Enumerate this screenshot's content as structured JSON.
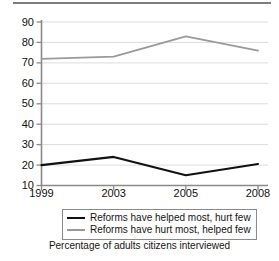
{
  "figure": {
    "top_rule": "horizontal-rule",
    "caption": "Percentage of adults citizens interviewed"
  },
  "legend": {
    "position": "below-axis",
    "entries": [
      {
        "label": "Reforms have helped most, hurt few",
        "color": "#111111",
        "swatch": "line-swatch-black"
      },
      {
        "label": "Reforms have hurt most, helped few",
        "color": "#9a9a9a",
        "swatch": "line-swatch-gray"
      }
    ]
  },
  "axes": {
    "y_ticks": [
      "90",
      "80",
      "70",
      "60",
      "50",
      "40",
      "30",
      "20",
      "10"
    ],
    "x_ticks": [
      "1999",
      "2003",
      "2005",
      "2008"
    ]
  },
  "chart_data": {
    "type": "line",
    "title": "",
    "subtitle": "",
    "xlabel": "",
    "ylabel": "",
    "caption": "Percentage of adults citizens interviewed",
    "categories": [
      "1999",
      "2003",
      "2005",
      "2008"
    ],
    "x": [
      1999,
      2003,
      2005,
      2008
    ],
    "series": [
      {
        "name": "Reforms have helped most, hurt few",
        "color": "#111111",
        "values": [
          20,
          24,
          15,
          20.5
        ]
      },
      {
        "name": "Reforms have hurt most, helped few",
        "color": "#9a9a9a",
        "values": [
          72,
          73,
          83,
          76
        ]
      }
    ],
    "ylim": [
      10,
      90
    ],
    "ytick_values": [
      10,
      20,
      30,
      40,
      50,
      60,
      70,
      80,
      90
    ],
    "ytick_labels": [
      "10",
      "20",
      "30",
      "40",
      "50",
      "60",
      "70",
      "80",
      "90"
    ],
    "xtick_labels": [
      "1999",
      "2003",
      "2005",
      "2008"
    ],
    "grid": {
      "horizontal": true,
      "vertical": false,
      "color": "#dcdcdc"
    },
    "legend_position": "below-axis",
    "axis_color": "#8a8a8a",
    "background": "#ffffff"
  }
}
